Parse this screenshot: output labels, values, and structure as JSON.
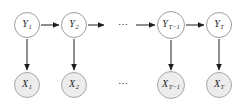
{
  "diagram": {
    "hidden_nodes": [
      {
        "base": "Y",
        "sub": "1"
      },
      {
        "base": "Y",
        "sub": "2"
      },
      {
        "base": "Y",
        "sub": "T−1"
      },
      {
        "base": "Y",
        "sub": "T"
      }
    ],
    "observed_nodes": [
      {
        "base": "X",
        "sub": "1"
      },
      {
        "base": "X",
        "sub": "2"
      },
      {
        "base": "X",
        "sub": "T−1"
      },
      {
        "base": "X",
        "sub": "T"
      }
    ],
    "ellipsis_top": "⋯",
    "ellipsis_bottom": "⋯",
    "edges": [
      "Y1→Y2",
      "Y2→⋯",
      "⋯→YT−1",
      "YT−1→YT",
      "Y1→X1",
      "Y2→X2",
      "YT−1→XT−1",
      "YT→XT"
    ],
    "colors": {
      "background": "#ffffff",
      "hidden_node_fill": "#ffffff",
      "observed_node_fill": "#ececec",
      "node_border": "#9e9e9e",
      "arrow": "#1c1c1c",
      "text": "#1f1f1f"
    }
  }
}
